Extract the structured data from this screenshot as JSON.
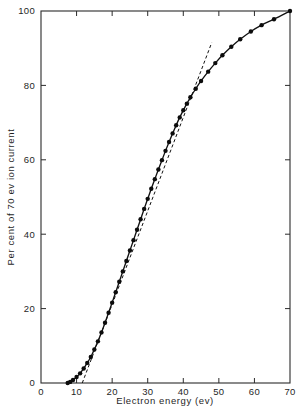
{
  "chart_data": {
    "type": "line",
    "title": "",
    "xlabel": "Electron energy (ev)",
    "ylabel": "Per cent of 70 ev ion current",
    "xlim": [
      0,
      70
    ],
    "ylim": [
      0,
      100
    ],
    "xticks": [
      0,
      10,
      20,
      30,
      40,
      50,
      60,
      70
    ],
    "yticks": [
      0,
      20,
      40,
      60,
      80,
      100
    ],
    "xtick_labels": [
      "0",
      "10",
      "20",
      "30",
      "40",
      "50",
      "60",
      "70"
    ],
    "ytick_labels": [
      "0",
      "20",
      "40",
      "60",
      "80",
      "100"
    ],
    "grid": false,
    "legend": null,
    "marker": "filled-circle",
    "line_color": "#111111",
    "marker_color": "#0c0c0c",
    "series": [
      {
        "name": "Ionization efficiency curve",
        "style": "solid-with-markers",
        "x": [
          7.5,
          8.2,
          9.0,
          10.0,
          11.0,
          12.0,
          13.0,
          14.0,
          15.0,
          16.0,
          17.0,
          18.0,
          19.0,
          20.0,
          21.0,
          22.0,
          23.0,
          24.0,
          25.0,
          26.0,
          27.0,
          28.0,
          29.0,
          30.0,
          31.0,
          32.0,
          33.0,
          34.0,
          35.0,
          36.0,
          37.0,
          38.0,
          39.0,
          40.0,
          41.0,
          42.0,
          43.5,
          45.0,
          47.0,
          49.0,
          51.0,
          53.5,
          56.0,
          59.0,
          62.0,
          65.5,
          70.0
        ],
        "y": [
          0.0,
          0.3,
          0.8,
          1.6,
          2.6,
          3.9,
          5.4,
          7.0,
          9.0,
          11.2,
          13.6,
          16.2,
          18.9,
          21.6,
          24.4,
          27.2,
          30.0,
          32.8,
          35.6,
          38.4,
          41.2,
          44.0,
          46.8,
          49.5,
          52.2,
          54.8,
          57.4,
          59.9,
          62.4,
          64.8,
          67.1,
          69.3,
          71.4,
          73.3,
          75.1,
          76.8,
          79.1,
          81.2,
          83.7,
          86.0,
          88.1,
          90.4,
          92.4,
          94.5,
          96.2,
          97.8,
          100.0
        ]
      },
      {
        "name": "Linear extrapolation (tangent)",
        "style": "dashed",
        "x": [
          11.6,
          48.0
        ],
        "y": [
          0.0,
          91.5
        ]
      }
    ],
    "annotations": [
      {
        "text": "",
        "note": "Dashed straight line extrapolated from the linear portion of the curve down to the energy axis intercept near 11.6 ev"
      }
    ]
  },
  "axes": {
    "frame": "box",
    "tick_direction": "in",
    "x_axis_name": "electron-energy-axis",
    "y_axis_name": "percent-ion-current-axis"
  }
}
